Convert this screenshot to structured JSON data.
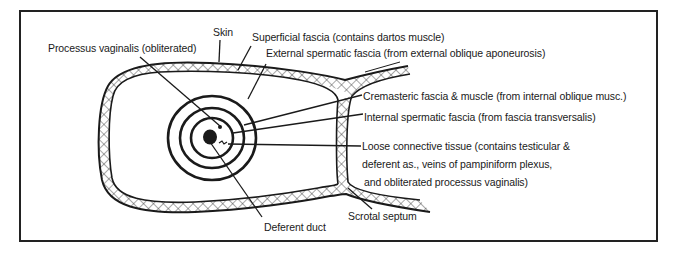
{
  "diagram": {
    "labels": {
      "skin": "Skin",
      "superficial_fascia": "Superficial fascia (contains dartos muscle)",
      "processus_vaginalis": "Processus vaginalis (obliterated)",
      "external_spermatic_fascia": "External spermatic fascia (from external oblique aponeurosis)",
      "cremasteric_fascia": "Cremasteric fascia & muscle (from internal oblique musc.)",
      "internal_spermatic_fascia": "Internal spermatic fascia (from fascia transversalis)",
      "loose_connective_1": "Loose connective tissue (contains testicular &",
      "loose_connective_2": "deferent as., veins of pampiniform plexus,",
      "loose_connective_3": "and obliterated processus vaginalis)",
      "scrotal_septum": "Scrotal septum",
      "deferent_duct": "Deferent duct"
    },
    "colors": {
      "line": "#1a1a1a",
      "background": "#ffffff"
    }
  }
}
